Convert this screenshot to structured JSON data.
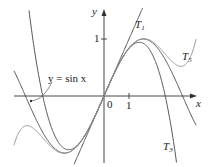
{
  "chart_data": {
    "type": "line",
    "title": "",
    "xlabel": "x",
    "ylabel": "y",
    "xlim": [
      -3.6,
      3.7
    ],
    "ylim": [
      -1.1,
      1.5
    ],
    "x_ticks": [
      {
        "value": 0,
        "label": "0"
      },
      {
        "value": 1,
        "label": "1"
      }
    ],
    "y_ticks": [
      {
        "value": 1,
        "label": "1"
      }
    ],
    "grid": false,
    "series": [
      {
        "name": "y = sin x",
        "formula": "sin(x)",
        "color": "#555555"
      },
      {
        "name": "T1",
        "formula": "x",
        "color": "#555555"
      },
      {
        "name": "T3",
        "formula": "x - x^3/6",
        "color": "#555555"
      },
      {
        "name": "T5",
        "formula": "x - x^3/6 + x^5/120",
        "color": "#999999"
      }
    ],
    "annotations": [
      {
        "text": "y = sin x",
        "pointer_to": "sin x curve"
      },
      {
        "text": "T1"
      },
      {
        "text": "T3"
      },
      {
        "text": "T5"
      }
    ]
  },
  "labels": {
    "y_axis": "y",
    "x_axis": "x",
    "origin": "0",
    "x_one": "1",
    "y_one": "1",
    "sin_label": "y = sin x",
    "t1": "T",
    "t1_sub": "1",
    "t3": "T",
    "t3_sub": "3",
    "t5": "T",
    "t5_sub": "5"
  },
  "axes": {
    "origin_px": [
      104,
      96
    ],
    "unit_px": [
      25,
      57
    ]
  }
}
